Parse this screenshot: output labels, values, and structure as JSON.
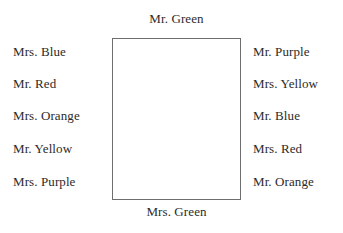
{
  "chart_title": "Seating Chart",
  "table": {
    "shape": "rectangle",
    "border_color": "#6e6e6e",
    "fill_color": "#ffffff"
  },
  "text_color": "#2b2b2b",
  "seats": {
    "top": [
      {
        "label": "Mr. Green"
      }
    ],
    "bottom": [
      {
        "label": "Mrs. Green"
      }
    ],
    "left": [
      {
        "label": "Mrs. Blue"
      },
      {
        "label": "Mr. Red"
      },
      {
        "label": "Mrs. Orange"
      },
      {
        "label": "Mr. Yellow"
      },
      {
        "label": "Mrs. Purple"
      }
    ],
    "right": [
      {
        "label": "Mr. Purple"
      },
      {
        "label": "Mrs. Yellow"
      },
      {
        "label": "Mr. Blue"
      },
      {
        "label": "Mrs. Red"
      },
      {
        "label": "Mr. Orange"
      }
    ]
  },
  "layout": {
    "left_rows_top": [
      44,
      76,
      108,
      141,
      174
    ],
    "right_rows_top": [
      44,
      76,
      108,
      141,
      174
    ]
  }
}
